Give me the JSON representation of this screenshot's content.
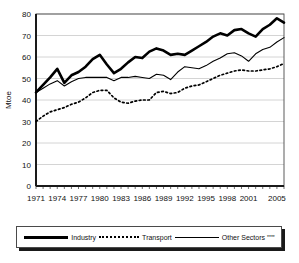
{
  "chart_data": {
    "type": "line",
    "title": "",
    "xlabel": "",
    "ylabel": "Mtoe",
    "ylim": [
      0,
      80
    ],
    "ytick_step": 10,
    "yticks": [
      "0",
      "10",
      "20",
      "30",
      "40",
      "50",
      "60",
      "70",
      "80"
    ],
    "xlim": [
      1971,
      2006
    ],
    "xticks": [
      "1971",
      "1974",
      "1977",
      "1980",
      "1983",
      "1986",
      "1989",
      "1992",
      "1995",
      "1998",
      "2001",
      "2005"
    ],
    "xtick_years": [
      1971,
      1974,
      1977,
      1980,
      1983,
      1986,
      1989,
      1992,
      1995,
      1998,
      2001,
      2005
    ],
    "grid": "horizontal",
    "legend_position": "below",
    "x": [
      1971,
      1972,
      1973,
      1974,
      1975,
      1976,
      1977,
      1978,
      1979,
      1980,
      1981,
      1982,
      1983,
      1984,
      1985,
      1986,
      1987,
      1988,
      1989,
      1990,
      1991,
      1992,
      1993,
      1994,
      1995,
      1996,
      1997,
      1998,
      1999,
      2000,
      2001,
      2002,
      2003,
      2004,
      2005,
      2006
    ],
    "series": [
      {
        "name": "Industry",
        "style": "thick-solid",
        "color": "#000000",
        "values": [
          43.5,
          47.0,
          50.5,
          54.5,
          48.0,
          51.5,
          53.0,
          55.5,
          59.0,
          61.0,
          56.5,
          52.5,
          54.5,
          57.5,
          60.0,
          59.5,
          62.5,
          64.0,
          63.0,
          61.0,
          61.5,
          61.0,
          63.0,
          65.0,
          67.0,
          69.5,
          71.0,
          70.0,
          72.5,
          73.0,
          71.0,
          69.5,
          73.0,
          75.0,
          78.0,
          76.0
        ]
      },
      {
        "name": "Transport",
        "style": "dotted",
        "color": "#000000",
        "values": [
          30.0,
          32.5,
          34.5,
          35.5,
          36.5,
          38.0,
          39.0,
          41.0,
          43.5,
          44.5,
          44.5,
          41.0,
          39.0,
          38.5,
          39.5,
          40.0,
          40.0,
          43.5,
          44.0,
          43.0,
          43.5,
          45.5,
          46.5,
          47.0,
          48.5,
          50.0,
          51.5,
          52.5,
          53.5,
          54.0,
          53.5,
          53.5,
          54.0,
          54.5,
          55.5,
          57.0
        ]
      },
      {
        "name": "Other Sectors****",
        "style": "thin-solid",
        "color": "#000000",
        "values": [
          43.5,
          45.5,
          47.5,
          49.0,
          46.5,
          48.5,
          50.0,
          50.5,
          50.5,
          50.5,
          50.5,
          49.0,
          50.5,
          50.5,
          51.0,
          50.5,
          50.0,
          52.0,
          51.5,
          49.5,
          53.0,
          55.5,
          55.0,
          54.5,
          56.0,
          58.0,
          59.5,
          61.5,
          62.0,
          60.5,
          58.0,
          61.5,
          63.5,
          64.5,
          67.0,
          69.0
        ]
      }
    ]
  },
  "legend": {
    "items": [
      {
        "label": "Industry",
        "marks": ""
      },
      {
        "label": "Transport",
        "marks": ""
      },
      {
        "label": "Other Sectors",
        "marks": "****"
      }
    ]
  }
}
